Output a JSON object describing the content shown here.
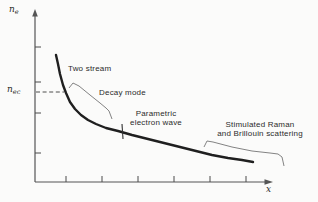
{
  "figure": {
    "width_px": 318,
    "height_px": 202,
    "background": "#fbfbfa",
    "curve_color": "#1f1f1f",
    "axis_color": "#555555",
    "tick_color": "#4a4a4a",
    "annotation_line_color": "#757575",
    "dashed_line_color": "#3a3a3a",
    "text_color": "#2b2b2b"
  },
  "labels": {
    "y_var": "n",
    "y_sub": "e",
    "y_crit_var": "n",
    "y_crit_sub": "ec",
    "x_var": "x",
    "region_two_stream": "Two stream",
    "region_decay_mode": "Decay mode",
    "region_parametric_l1": "Parametric",
    "region_parametric_l2": "electron wave",
    "region_raman_l1": "Stimulated Raman",
    "region_raman_l2": "and Brillouin scattering"
  },
  "chart_data": {
    "type": "line",
    "title": "",
    "xlabel": "x",
    "ylabel": "n_e",
    "y_reference_label": "n_ec",
    "axes_unlabeled": true,
    "x_tick_labels": [
      "",
      "",
      "",
      "",
      "",
      ""
    ],
    "y_tick_labels": [
      "",
      "",
      "",
      ""
    ],
    "series": [
      {
        "name": "n_e vs x (monotonically decaying electron density)",
        "points_px": [
          [
            56,
            55
          ],
          [
            58,
            64
          ],
          [
            60,
            74
          ],
          [
            63,
            85
          ],
          [
            66,
            93
          ],
          [
            70,
            102
          ],
          [
            75,
            109
          ],
          [
            81,
            115
          ],
          [
            88,
            120
          ],
          [
            96,
            124
          ],
          [
            106,
            128
          ],
          [
            118,
            131
          ],
          [
            132,
            135
          ],
          [
            148,
            139
          ],
          [
            164,
            143
          ],
          [
            180,
            147
          ],
          [
            196,
            151
          ],
          [
            212,
            155
          ],
          [
            228,
            158
          ],
          [
            242,
            160
          ],
          [
            253,
            162
          ]
        ]
      }
    ],
    "regions_in_order_of_decreasing_density": [
      "Two stream",
      "Decay mode",
      "Parametric electron wave",
      "Stimulated Raman and Brillouin scattering"
    ],
    "layout_px": {
      "origin": [
        35,
        182
      ],
      "y_axis_top": 15,
      "y_arrow_tip": 9,
      "x_axis_right": 266,
      "x_arrow_tip": 273,
      "x_ticks": [
        66,
        102,
        138,
        174,
        210,
        246
      ],
      "y_ticks": [
        47,
        82,
        113,
        153
      ],
      "tick_len": 6,
      "dashed_reference": [
        36,
        92,
        64,
        92
      ],
      "decay_mode_bracket": [
        [
          69,
          88
        ],
        [
          73,
          83
        ],
        [
          79,
          86
        ],
        [
          90,
          95
        ],
        [
          100,
          103
        ],
        [
          106,
          108
        ],
        [
          109,
          111
        ],
        [
          112,
          119
        ]
      ],
      "parametric_boundary_tick": [
        122,
        124,
        123,
        139
      ],
      "raman_bracket": [
        [
          204,
          147
        ],
        [
          207,
          141
        ],
        [
          213,
          142
        ],
        [
          232,
          147
        ],
        [
          252,
          151
        ],
        [
          270,
          153
        ],
        [
          278,
          154
        ],
        [
          282,
          157
        ],
        [
          284,
          166
        ]
      ]
    },
    "legend": "none",
    "grid": false
  }
}
